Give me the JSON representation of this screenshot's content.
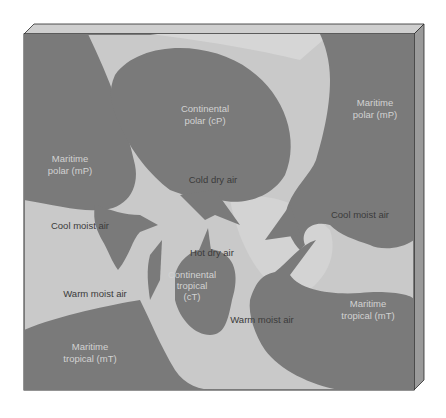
{
  "colors": {
    "background": "#ffffff",
    "air_mass_fill": "#7a7a7a",
    "ground_fill": "#c9c9c9",
    "ground_highlight": "#d6d6d6",
    "frame_top": "#cfcfcf",
    "frame_side": "#9a9a9a",
    "frame_outline": "#2a2a2a"
  },
  "air_masses": [
    {
      "id": "cP",
      "line1": "Continental",
      "line2": "polar (cP)"
    },
    {
      "id": "mP_west",
      "line1": "Maritime",
      "line2": "polar (mP)"
    },
    {
      "id": "mP_east",
      "line1": "Maritime",
      "line2": "polar (mP)"
    },
    {
      "id": "cT",
      "line1": "Continental",
      "line2": "tropical",
      "line3": "(cT)"
    },
    {
      "id": "mT_west",
      "line1": "Maritime",
      "line2": "tropical (mT)"
    },
    {
      "id": "mT_east",
      "line1": "Maritime",
      "line2": "tropical (mT)"
    }
  ],
  "air_flows": [
    {
      "id": "cold_dry",
      "label": "Cold dry air"
    },
    {
      "id": "cool_moist_west",
      "label": "Cool moist air"
    },
    {
      "id": "cool_moist_east",
      "label": "Cool moist air"
    },
    {
      "id": "hot_dry",
      "label": "Hot dry air"
    },
    {
      "id": "warm_moist_west",
      "label": "Warm moist air"
    },
    {
      "id": "warm_moist_east",
      "label": "Warm moist air"
    }
  ]
}
